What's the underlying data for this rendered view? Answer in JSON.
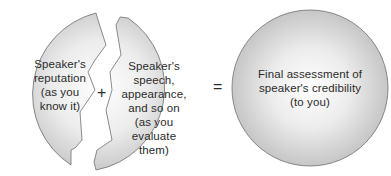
{
  "diagram": {
    "type": "equation-of-circles",
    "left_piece": {
      "lines": [
        "Speaker's",
        "reputation",
        "(as you",
        "know it)"
      ]
    },
    "right_piece": {
      "lines": [
        "Speaker's",
        "speech,",
        "appearance,",
        "and so on",
        "(as you",
        "evaluate",
        "them)"
      ]
    },
    "result_circle": {
      "lines": [
        "Final assessment of",
        "speaker's credibility",
        "(to you)"
      ]
    },
    "operators": {
      "plus": "+",
      "equals": "="
    },
    "colors": {
      "fill_center": "#ffffff",
      "fill_edge": "#c9c9c9",
      "stroke": "#6e6e6e",
      "text": "#2b2b2b"
    }
  }
}
